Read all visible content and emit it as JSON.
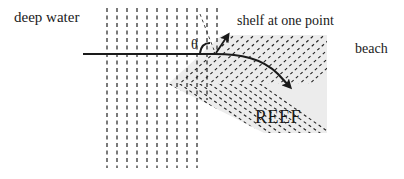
{
  "diagram": {
    "type": "wave-refraction-at-reef",
    "labels": {
      "deep_water": "deep water",
      "shelf": "shelf at one point",
      "beach": "beach",
      "reef": "REEF",
      "angle": "θ"
    },
    "colors": {
      "ink": "#1a1a1a",
      "reef_fill": "#ececec",
      "dash": "#222222"
    },
    "wave_fronts": {
      "count": 12,
      "orientation": "vertical-dashed",
      "x_start": 107,
      "spacing": 10
    },
    "ray": {
      "incident": "horizontal from left",
      "refracted": "curves down-right after crossing shelf",
      "normal_arrow": "short arrow pointing up-right at shelf point"
    }
  }
}
